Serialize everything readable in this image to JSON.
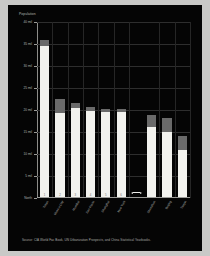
{
  "figure": {
    "background_color": "#050505",
    "page_background_color": "#c9c9c7",
    "bar_color": "#f2f2ee",
    "bar_cap_color": "#6a6a6a",
    "grid_color": "#2e2e2e",
    "axis_color": "#9b9b98",
    "source_note": "Source: CIA World Fac Book, UN Urbanization Prospects, and China Statistical Yearbooks.",
    "gap_marker": "double-headed-arrow"
  },
  "chart_data": {
    "type": "bar",
    "title": "",
    "subtitle": "",
    "ylabel": "Population",
    "xlabel": "",
    "ylim": [
      0,
      40
    ],
    "yticks": [
      0,
      5,
      10,
      15,
      20,
      25,
      30,
      35,
      40
    ],
    "ytick_labels": [
      "North",
      "5 mil",
      "10 mil",
      "15 mil",
      "20 mil",
      "25 mil",
      "30 mil",
      "35 mil",
      "40 mil"
    ],
    "grid": true,
    "legend": "none",
    "categories": [
      "Tokyo",
      "Mexico City",
      "Mumbai",
      "Sao Paulo",
      "Shanghai",
      "New York",
      "Shenzhen",
      "Beijing",
      "Tianjin"
    ],
    "ranks": [
      "1",
      "2",
      "3",
      "4",
      "5",
      "6",
      "",
      "",
      ""
    ],
    "series": [
      {
        "name": "City population",
        "values": [
          34.5,
          19.3,
          20.5,
          19.8,
          19.6,
          19.6,
          16.1,
          14.9,
          10.9
        ]
      },
      {
        "name": "Growth increment",
        "values": [
          1.3,
          3.1,
          1.1,
          0.9,
          0.6,
          0.6,
          2.7,
          3.2,
          3.1
        ]
      }
    ],
    "totals": [
      35.8,
      22.4,
      21.6,
      20.7,
      20.2,
      20.2,
      18.8,
      18.1,
      14.0
    ],
    "gap_after_category_index": 5,
    "annotations": [
      {
        "type": "gap-arrow",
        "label": "",
        "position": "x-axis between rank 6 and Shenzhen"
      }
    ]
  }
}
